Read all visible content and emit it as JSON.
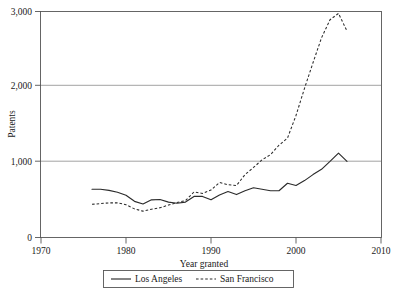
{
  "chart_data": {
    "type": "line",
    "title": "",
    "xlabel": "Year granted",
    "ylabel": "Patents",
    "xlim": [
      1970,
      2010
    ],
    "ylim": [
      0,
      3000
    ],
    "xticks": [
      1970,
      1980,
      1990,
      2000,
      2010
    ],
    "xtick_labels": [
      "1970",
      "1980",
      "1990",
      "2000",
      "2010"
    ],
    "yticks": [
      0,
      1000,
      2000,
      3000
    ],
    "ytick_labels": [
      "0",
      "1,000",
      "2,000",
      "3,000"
    ],
    "grid": "horizontal",
    "legend_position": "below-axes",
    "x": [
      1976,
      1977,
      1978,
      1979,
      1980,
      1981,
      1982,
      1983,
      1984,
      1985,
      1986,
      1987,
      1988,
      1989,
      1990,
      1991,
      1992,
      1993,
      1994,
      1995,
      1996,
      1997,
      1998,
      1999,
      2000,
      2001,
      2002,
      2003,
      2004,
      2005,
      2006
    ],
    "series": [
      {
        "name": "Los Angeles",
        "style": "solid",
        "values": [
          640,
          640,
          625,
          600,
          560,
          480,
          445,
          500,
          505,
          470,
          455,
          470,
          545,
          545,
          500,
          565,
          610,
          570,
          620,
          660,
          640,
          620,
          620,
          720,
          690,
          755,
          835,
          905,
          1010,
          1120,
          1010
        ]
      },
      {
        "name": "San Francisco",
        "style": "dashed",
        "values": [
          440,
          450,
          460,
          460,
          435,
          380,
          350,
          375,
          395,
          430,
          465,
          490,
          605,
          585,
          630,
          730,
          700,
          690,
          835,
          930,
          1030,
          1100,
          1225,
          1320,
          1620,
          1980,
          2320,
          2650,
          2890,
          2975,
          2740
        ]
      }
    ]
  },
  "legend": {
    "items": [
      {
        "label": "Los Angeles",
        "style": "solid"
      },
      {
        "label": "San Francisco",
        "style": "dashed"
      }
    ]
  }
}
